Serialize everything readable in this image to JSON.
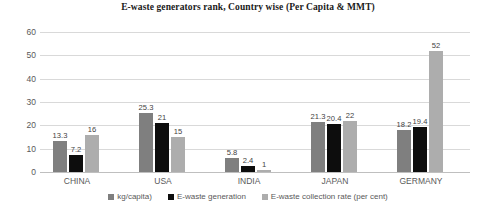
{
  "chart_data": {
    "type": "bar",
    "title": "E-waste generators rank, Country wise (Per Capita & MMT)",
    "xlabel": "",
    "ylabel": "",
    "ylim": [
      0,
      60
    ],
    "yticks": [
      "0",
      "10",
      "20",
      "30",
      "40",
      "50",
      "60"
    ],
    "grid": true,
    "legend_position": "bottom",
    "categories": [
      "CHINA",
      "USA",
      "INDIA",
      "JAPAN",
      "GERMANY"
    ],
    "series": [
      {
        "name": "kg/capita)",
        "color": "#7f7f7f",
        "values": [
          13.3,
          25.3,
          5.8,
          21.3,
          18.2
        ],
        "labels": [
          "13.3",
          "25.3",
          "5.8",
          "21.3",
          "18.2"
        ]
      },
      {
        "name": "E-waste generation",
        "color": "#0d0d0d",
        "values": [
          7.2,
          21,
          2.4,
          20.4,
          19.4
        ],
        "labels": [
          "7.2",
          "21",
          "2.4",
          "20.4",
          "19.4"
        ]
      },
      {
        "name": "E-waste collection rate (per cent)",
        "color": "#adadad",
        "values": [
          16,
          15,
          1,
          22,
          52
        ],
        "labels": [
          "16",
          "15",
          "1",
          "22",
          "52"
        ]
      }
    ]
  }
}
